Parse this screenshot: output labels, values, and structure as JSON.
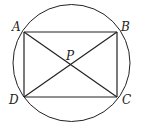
{
  "diagram": {
    "type": "circle-inscribed-rectangle",
    "stroke_color": "#222222",
    "background": "#ffffff",
    "circle": {
      "cx": 71.5,
      "cy": 63,
      "r": 58.5
    },
    "points": {
      "A": {
        "label": "A",
        "x": 24,
        "y": 32,
        "lx": 12,
        "ly": 31
      },
      "B": {
        "label": "B",
        "x": 117,
        "y": 32,
        "lx": 121,
        "ly": 31
      },
      "C": {
        "label": "C",
        "x": 117,
        "y": 97,
        "lx": 122,
        "ly": 104
      },
      "D": {
        "label": "D",
        "x": 24,
        "y": 97,
        "lx": 9,
        "ly": 104
      },
      "P": {
        "label": "P",
        "x": 70.5,
        "y": 64.5,
        "lx": 66,
        "ly": 60
      }
    },
    "segments": [
      [
        "A",
        "B"
      ],
      [
        "B",
        "C"
      ],
      [
        "C",
        "D"
      ],
      [
        "D",
        "A"
      ],
      [
        "A",
        "C"
      ],
      [
        "B",
        "D"
      ]
    ]
  }
}
